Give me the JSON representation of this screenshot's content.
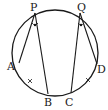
{
  "diagram": {
    "type": "circle-geometry",
    "circle": {
      "cx": 55,
      "cy": 53,
      "r": 43,
      "stroke": "#1a1a1a"
    },
    "points": [
      {
        "id": "P",
        "label": "P",
        "x": 35,
        "y": 13,
        "lx": 30,
        "ly": 11
      },
      {
        "id": "Q",
        "label": "Q",
        "x": 80,
        "y": 13,
        "lx": 77,
        "ly": 11
      },
      {
        "id": "A",
        "label": "A",
        "x": 19,
        "y": 63,
        "lx": 7,
        "ly": 70
      },
      {
        "id": "B",
        "label": "B",
        "x": 48,
        "y": 94,
        "lx": 44,
        "ly": 106
      },
      {
        "id": "C",
        "label": "C",
        "x": 71,
        "y": 93,
        "lx": 65,
        "ly": 106
      },
      {
        "id": "D",
        "label": "D",
        "x": 97,
        "y": 64,
        "lx": 97,
        "ly": 73
      }
    ],
    "segments": [
      {
        "from": "P",
        "to": "A"
      },
      {
        "from": "P",
        "to": "B"
      },
      {
        "from": "Q",
        "to": "C"
      },
      {
        "from": "Q",
        "to": "D"
      }
    ],
    "angle_marks": [
      {
        "at": "P",
        "type": "dot",
        "x": 35,
        "y": 25
      },
      {
        "at": "Q",
        "type": "dot",
        "x": 81,
        "y": 25
      }
    ],
    "arc_ticks": [
      {
        "arc": "AB",
        "x": 30,
        "y": 81
      },
      {
        "arc": "CD",
        "x": 88,
        "y": 80
      }
    ]
  }
}
